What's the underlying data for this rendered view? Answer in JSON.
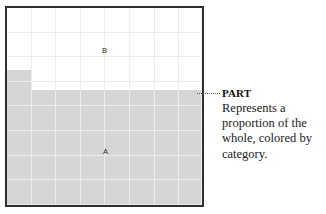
{
  "chart_data": {
    "type": "area",
    "title": "",
    "xlabel": "",
    "ylabel": "",
    "grid": true,
    "legend_position": "inline-labels",
    "stacked": true,
    "xlim": [
      0,
      8
    ],
    "ylim": [
      0,
      100
    ],
    "x": [
      0,
      1,
      2,
      3,
      4,
      5,
      6,
      7,
      8
    ],
    "series": [
      {
        "name": "A",
        "label": "A",
        "color": "#d6d6d6",
        "values": [
          69,
          59,
          59,
          59,
          59,
          59,
          59,
          59,
          59
        ]
      },
      {
        "name": "B",
        "label": "B",
        "color": "#ffffff",
        "values": [
          31,
          41,
          41,
          41,
          41,
          41,
          41,
          41,
          41
        ]
      }
    ],
    "annotations": [
      {
        "target_series": "A",
        "title": "PART",
        "body": "Represents a proportion of the whole, colored by category."
      }
    ]
  },
  "plot": {
    "frame_color": "#2f2f2f",
    "grid_color": "#ececec",
    "background": "#ffffff",
    "series_label_a": "A",
    "series_label_b": "B"
  },
  "annotation": {
    "title": "PART",
    "body": "Represents a proportion of the whole, colored by category.",
    "leader_icon": "dotted-leader-line"
  }
}
